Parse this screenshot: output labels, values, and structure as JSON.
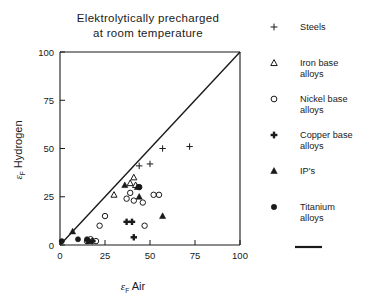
{
  "chart_data": {
    "type": "scatter",
    "title": "Elektrolytically precharged at room temperature",
    "title_line1": "Elektrolytically precharged",
    "title_line2": "at room temperature",
    "xlabel_symbol": "ε",
    "xlabel_sub": "F",
    "xlabel_rest": "Air",
    "ylabel_symbol": "ε",
    "ylabel_sub": "F",
    "ylabel_rest": "Hydrogen",
    "xlim": [
      0,
      100
    ],
    "ylim": [
      0,
      100
    ],
    "xticks": [
      0,
      25,
      50,
      75,
      100
    ],
    "yticks": [
      0,
      25,
      50,
      75,
      100
    ],
    "xtick_labels": [
      "0",
      "25",
      "50",
      "75",
      "100"
    ],
    "ytick_labels": [
      "0",
      "25",
      "50",
      "75",
      "100"
    ],
    "grid": false,
    "legend_position": "right",
    "reference_line": {
      "name": "one-to-one-line",
      "from": [
        0,
        0
      ],
      "to": [
        100,
        100
      ]
    },
    "series": [
      {
        "name": "Steels",
        "marker": "thin-plus",
        "points": [
          [
            44,
            41
          ],
          [
            50,
            42
          ],
          [
            57,
            50
          ],
          [
            72,
            51
          ]
        ]
      },
      {
        "name": "Iron base alloys",
        "marker": "open-triangle",
        "points": [
          [
            30,
            26
          ],
          [
            39,
            32
          ],
          [
            41,
            35
          ],
          [
            42,
            31
          ]
        ]
      },
      {
        "name": "Nickel base alloys",
        "marker": "open-circle",
        "points": [
          [
            15,
            2
          ],
          [
            17,
            3
          ],
          [
            20,
            2
          ],
          [
            22,
            10
          ],
          [
            25,
            15
          ],
          [
            37,
            24
          ],
          [
            39,
            27
          ],
          [
            41,
            23
          ],
          [
            44,
            30
          ],
          [
            46,
            22
          ],
          [
            47,
            10
          ],
          [
            52,
            26
          ],
          [
            55,
            26
          ]
        ]
      },
      {
        "name": "Copper base alloys",
        "marker": "bold-plus",
        "points": [
          [
            18,
            2
          ],
          [
            37,
            12
          ],
          [
            40,
            12
          ],
          [
            41,
            4
          ]
        ]
      },
      {
        "name": "IP's",
        "marker": "filled-triangle",
        "points": [
          [
            7,
            7
          ],
          [
            16,
            2
          ],
          [
            36,
            31
          ],
          [
            43,
            30
          ],
          [
            44,
            25
          ],
          [
            57,
            15
          ]
        ]
      },
      {
        "name": "Titanium alloys",
        "marker": "filled-circle",
        "points": [
          [
            1,
            2
          ],
          [
            10,
            3
          ],
          [
            15,
            3
          ],
          [
            16,
            2
          ],
          [
            44,
            30
          ]
        ]
      }
    ]
  },
  "legend": {
    "items": [
      {
        "marker": "thin-plus",
        "label_line1": "Steels",
        "label_line2": ""
      },
      {
        "marker": "open-triangle",
        "label_line1": "Iron base",
        "label_line2": "alloys"
      },
      {
        "marker": "open-circle",
        "label_line1": "Nickel base",
        "label_line2": "alloys"
      },
      {
        "marker": "bold-plus",
        "label_line1": "Copper base",
        "label_line2": "alloys"
      },
      {
        "marker": "filled-triangle",
        "label_line1": "IP's",
        "label_line2": ""
      },
      {
        "marker": "filled-circle",
        "label_line1": "Titanium",
        "label_line2": "alloys"
      }
    ]
  },
  "colors": {
    "ink": "#1a1a1a",
    "background": "#ffffff"
  }
}
